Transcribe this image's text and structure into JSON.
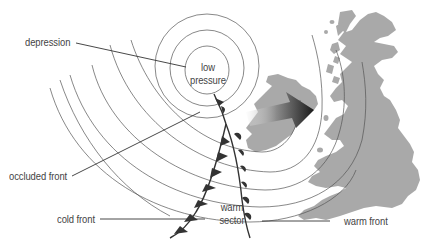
{
  "diagram": {
    "labels": {
      "depression": "depression",
      "low_pressure_line1": "low",
      "low_pressure_line2": "pressure",
      "occluded_front": "occluded front",
      "cold_front": "cold front",
      "warm_sector_line1": "warm",
      "warm_sector_line2": "sector",
      "warm_front": "warm front"
    },
    "colors": {
      "isobar": "#555555",
      "front": "#333333",
      "land": "#a9a9a9",
      "arrow_dark": "#1e1e1e",
      "arrow_light": "#e8e8e8",
      "text": "#444444",
      "leader": "#333333",
      "background": "#ffffff"
    },
    "elements": {
      "isobars": "concentric isobars around low pressure centre",
      "fronts": [
        "occluded front",
        "cold front",
        "warm front"
      ],
      "arrow": "direction of movement towards the east (British Isles)",
      "landmass": "British Isles and Ireland"
    }
  }
}
